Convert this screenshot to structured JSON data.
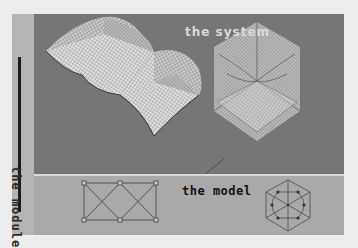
{
  "labels": {
    "system": "the system",
    "model": "the model",
    "module": "the module"
  },
  "colors": {
    "page_bg": "#ededed",
    "top_panel": "#767676",
    "bottom_panel": "#a9a9a9",
    "side_strip": "#b4b4b4",
    "mesh_light": "#e6e6e6",
    "mesh_line": "#5a5a5a",
    "model_line": "#4a4a4a"
  },
  "figures": {
    "surface_mesh": "doubly-curved vaulted grid shell (two folded bays)",
    "hex_mesh": "hexagonal grid shell with three folded ridges",
    "rect_model": {
      "nodes": 6,
      "shape": "rectangle with double X bracing"
    },
    "hex_model": {
      "nodes": 12,
      "shape": "hexagon with radial spokes and inner ring"
    }
  }
}
